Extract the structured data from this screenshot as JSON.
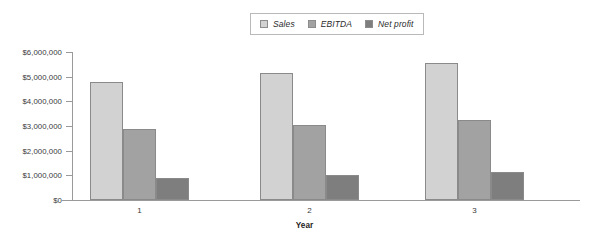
{
  "chart_data": {
    "type": "bar",
    "title": "",
    "subtitle": "",
    "xlabel": "Year",
    "ylabel": "",
    "categories": [
      "1",
      "2",
      "3"
    ],
    "series": [
      {
        "name": "Sales",
        "values": [
          4800000,
          5150000,
          5550000
        ],
        "color": "#d2d2d2"
      },
      {
        "name": "EBITDA",
        "values": [
          2880000,
          3050000,
          3250000
        ],
        "color": "#a2a2a2"
      },
      {
        "name": "Net profit",
        "values": [
          900000,
          1030000,
          1150000
        ],
        "color": "#7e7e7e"
      }
    ],
    "ylim": [
      0,
      6000000
    ],
    "ytick_values": [
      0,
      1000000,
      2000000,
      3000000,
      4000000,
      5000000,
      6000000
    ],
    "ytick_labels": [
      "$0",
      "$1,000,000",
      "$2,000,000",
      "$3,000,000",
      "$4,000,000",
      "$5,000,000",
      "$6,000,000"
    ],
    "grid": false,
    "legend_position": "top-center",
    "legend_entries": [
      "Sales",
      "EBITDA",
      "Net profit"
    ],
    "bar_border_color": "#8a8a8a",
    "axis_color": "#9a9a9a",
    "text_color": "#3a3a3a"
  },
  "legend": {
    "entries": [
      {
        "label": "Sales"
      },
      {
        "label": "EBITDA"
      },
      {
        "label": "Net profit"
      }
    ]
  },
  "axes": {
    "x_title": "Year",
    "x_labels": [
      "1",
      "2",
      "3"
    ],
    "y_labels": [
      "$6,000,000",
      "$5,000,000",
      "$4,000,000",
      "$3,000,000",
      "$2,000,000",
      "$1,000,000",
      "$0"
    ]
  }
}
